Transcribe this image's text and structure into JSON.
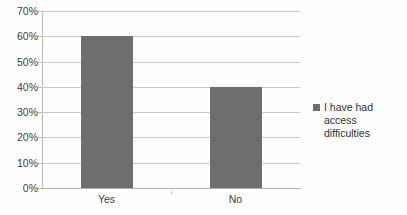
{
  "chart_data": {
    "type": "bar",
    "title": "",
    "xlabel": "",
    "ylabel": "",
    "categories": [
      "Yes",
      "No"
    ],
    "values": [
      60,
      40
    ],
    "series": [
      {
        "name": "I have had access difficulties",
        "values": [
          60,
          40
        ]
      }
    ],
    "ylim": [
      0,
      70
    ],
    "ytick_step": 10,
    "ytick_labels": [
      "0%",
      "10%",
      "20%",
      "30%",
      "40%",
      "50%",
      "60%",
      "70%"
    ],
    "ytick_values": [
      0,
      10,
      20,
      30,
      40,
      50,
      60,
      70
    ],
    "value_suffix": "%",
    "grid": true,
    "legend_position": "right",
    "bar_color": "#6e6e6e",
    "gridline_color": "#c9c9c9",
    "axis_color": "#b9b9b9",
    "text_color": "#3c3c3c",
    "background_color": "#fefefe"
  },
  "legend": {
    "entries": [
      {
        "label": "I have had access difficulties",
        "color": "#6e6e6e"
      }
    ]
  }
}
